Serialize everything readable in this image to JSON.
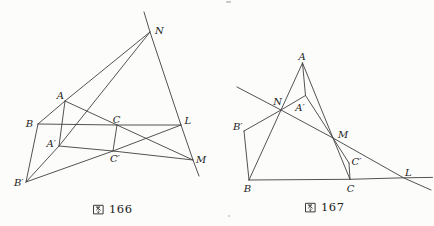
{
  "page": {
    "background": "#fcfcfb",
    "line_color": "#3f3f3f",
    "label_color": "#1c1c1c"
  },
  "figures": [
    {
      "id": "figure-166",
      "caption": "图 166",
      "caption_prefix": "图",
      "caption_number": "166",
      "stroke": "#3f3f3f",
      "stroke_width": 0.9,
      "points": {
        "N": [
          150,
          32
        ],
        "A": [
          65,
          101
        ],
        "B": [
          38,
          124
        ],
        "C": [
          117,
          125
        ],
        "L": [
          181,
          125
        ],
        "Ap": [
          59,
          146
        ],
        "Cp": [
          113,
          151
        ],
        "M": [
          193,
          160
        ],
        "Bp": [
          26,
          182
        ],
        "axis_top": [
          144,
          12
        ],
        "axis_bottom": [
          199,
          176
        ]
      },
      "lines": [
        {
          "name": "axis-N-L-M",
          "pts": [
            "axis_top",
            "N",
            "L",
            "M",
            "axis_bottom"
          ]
        },
        {
          "name": "line-B-A-N",
          "pts": [
            "B",
            "A",
            "N"
          ]
        },
        {
          "name": "line-Bp-Ap-N",
          "pts": [
            "Bp",
            "Ap",
            "N"
          ]
        },
        {
          "name": "line-B-C-L",
          "pts": [
            "B",
            "C",
            "L"
          ]
        },
        {
          "name": "line-Bp-Cp-L",
          "pts": [
            "Bp",
            "Cp",
            "L"
          ]
        },
        {
          "name": "line-A-C-M",
          "pts": [
            "A",
            "C",
            "M"
          ]
        },
        {
          "name": "line-Ap-Cp-M",
          "pts": [
            "Ap",
            "Cp",
            "M"
          ]
        },
        {
          "name": "segment-A-Ap",
          "pts": [
            "A",
            "Ap"
          ]
        },
        {
          "name": "segment-B-Bp",
          "pts": [
            "B",
            "Bp"
          ]
        },
        {
          "name": "segment-C-Cp",
          "pts": [
            "C",
            "Cp"
          ]
        }
      ],
      "labels": [
        {
          "name": "N",
          "text": "N",
          "x": 155,
          "y": 34,
          "anchor": "start"
        },
        {
          "name": "A",
          "text": "A",
          "x": 64,
          "y": 99,
          "anchor": "end"
        },
        {
          "name": "B",
          "text": "B",
          "x": 33,
          "y": 127,
          "anchor": "end"
        },
        {
          "name": "C",
          "text": "C",
          "x": 116.5,
          "y": 122.5,
          "anchor": "middle"
        },
        {
          "name": "L",
          "text": "L",
          "x": 184.5,
          "y": 124,
          "anchor": "start"
        },
        {
          "name": "A-prime",
          "text": "A′",
          "x": 56,
          "y": 146.5,
          "anchor": "end"
        },
        {
          "name": "C-prime",
          "text": "C′",
          "x": 115,
          "y": 161.5,
          "anchor": "middle"
        },
        {
          "name": "M",
          "text": "M",
          "x": 196,
          "y": 163,
          "anchor": "start"
        },
        {
          "name": "B-prime",
          "text": "B′",
          "x": 23.5,
          "y": 185.5,
          "anchor": "end"
        }
      ]
    },
    {
      "id": "figure-167",
      "caption": "图 167",
      "caption_prefix": "图",
      "caption_number": "167",
      "stroke": "#3f3f3f",
      "stroke_width": 0.9,
      "points": {
        "A": [
          302.5,
          63
        ],
        "B": [
          249,
          180
        ],
        "C": [
          350,
          179.3
        ],
        "Ap": [
          305.5,
          95.5
        ],
        "Bp": [
          244,
          131
        ],
        "Cp": [
          349,
          163
        ],
        "N": [
          281,
          110
        ],
        "M": [
          333,
          138
        ],
        "L": [
          403.5,
          177.8
        ],
        "axis_start": [
          237,
          87
        ],
        "axis_end": [
          431,
          190
        ],
        "base_end": [
          432.5,
          177.4
        ]
      },
      "lines": [
        {
          "name": "axis-N-M-L",
          "pts": [
            "axis_start",
            "N",
            "M",
            "L",
            "axis_end"
          ]
        },
        {
          "name": "line-B-C-L",
          "pts": [
            "B",
            "C",
            "L",
            "base_end"
          ]
        },
        {
          "name": "line-A-N-B",
          "pts": [
            "A",
            "N",
            "B"
          ]
        },
        {
          "name": "line-A-M-C",
          "pts": [
            "A",
            "M",
            "C"
          ]
        },
        {
          "name": "line-Ap-N-Bp",
          "pts": [
            "Ap",
            "N",
            "Bp"
          ]
        },
        {
          "name": "line-Ap-M-Cp",
          "pts": [
            "Ap",
            "M",
            "Cp"
          ]
        },
        {
          "name": "segment-A-Ap",
          "pts": [
            "A",
            "Ap"
          ]
        },
        {
          "name": "segment-B-Bp",
          "pts": [
            "B",
            "Bp"
          ]
        },
        {
          "name": "segment-C-Cp",
          "pts": [
            "C",
            "Cp"
          ]
        }
      ],
      "labels": [
        {
          "name": "A",
          "text": "A",
          "x": 302,
          "y": 59.5,
          "anchor": "middle"
        },
        {
          "name": "N",
          "text": "N",
          "x": 282,
          "y": 105,
          "anchor": "end"
        },
        {
          "name": "A-prime",
          "text": "A′",
          "x": 300,
          "y": 110.5,
          "anchor": "middle"
        },
        {
          "name": "B-prime",
          "text": "B′",
          "x": 242.5,
          "y": 129.5,
          "anchor": "end"
        },
        {
          "name": "M",
          "text": "M",
          "x": 338,
          "y": 138,
          "anchor": "start"
        },
        {
          "name": "C-prime",
          "text": "C′",
          "x": 351.5,
          "y": 164.5,
          "anchor": "start"
        },
        {
          "name": "L",
          "text": "L",
          "x": 405,
          "y": 176,
          "anchor": "start"
        },
        {
          "name": "B",
          "text": "B",
          "x": 247.5,
          "y": 192,
          "anchor": "middle"
        },
        {
          "name": "C",
          "text": "C",
          "x": 350.5,
          "y": 191.5,
          "anchor": "middle"
        }
      ]
    }
  ],
  "marks": [
    {
      "name": "scan-speck-top",
      "x": 226,
      "y": 1,
      "w": 5,
      "h": 2
    },
    {
      "name": "scan-speck-bottom",
      "x": 228,
      "y": 215,
      "w": 2,
      "h": 2
    }
  ]
}
